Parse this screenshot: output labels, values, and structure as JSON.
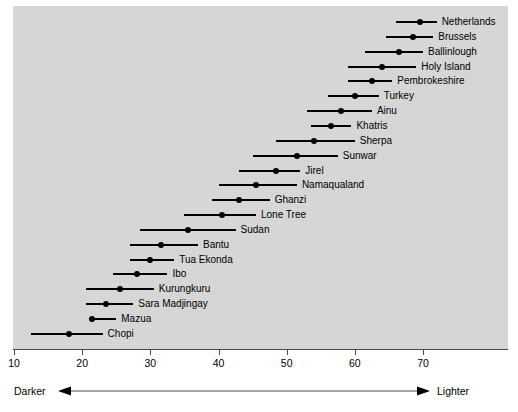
{
  "chart_data": {
    "type": "scatter",
    "title": "",
    "xlabel": "",
    "ylabel": "",
    "xlim": [
      10,
      76
    ],
    "xticks": [
      10,
      20,
      30,
      40,
      50,
      60,
      70
    ],
    "xtick_labels": [
      "10",
      "20",
      "30",
      "40",
      "50",
      "60",
      "70"
    ],
    "grid": false,
    "legend": null,
    "orientation": "horizontal",
    "marker": "point-with-range-line",
    "annotations": {
      "left_axis_note": "Darker",
      "right_axis_note": "Lighter",
      "arrow": "double-headed-horizontal-arrow"
    },
    "categories": [
      "Netherlands",
      "Brussels",
      "Ballinlough",
      "Holy Island",
      "Pembrokeshire",
      "Turkey",
      "Ainu",
      "Khatris",
      "Sherpa",
      "Sunwar",
      "Jirel",
      "Namaqualand",
      "Ghanzi",
      "Lone Tree",
      "Sudan",
      "Bantu",
      "Tua Ekonda",
      "Ibo",
      "Kurungkuru",
      "Sara Madjingay",
      "Mazua",
      "Chopi"
    ],
    "values": [
      69.5,
      68.5,
      66.5,
      64.0,
      62.5,
      60.0,
      58.0,
      56.5,
      54.0,
      51.5,
      48.5,
      45.5,
      43.0,
      40.5,
      35.5,
      31.5,
      30.0,
      28.0,
      25.5,
      23.5,
      21.5,
      18.0
    ],
    "range_low": [
      66.0,
      64.5,
      61.5,
      59.0,
      59.0,
      56.0,
      53.0,
      53.5,
      48.5,
      45.0,
      43.0,
      40.0,
      39.0,
      35.0,
      28.5,
      27.0,
      27.0,
      24.5,
      20.5,
      20.5,
      21.0,
      12.5
    ],
    "range_high": [
      72.0,
      71.5,
      70.0,
      69.0,
      65.5,
      63.5,
      62.5,
      59.5,
      60.0,
      57.5,
      52.0,
      51.5,
      47.5,
      45.5,
      42.5,
      37.0,
      33.5,
      32.5,
      30.5,
      27.5,
      25.0,
      23.0
    ],
    "series": [
      {
        "name": "reflectance",
        "values": [
          69.5,
          68.5,
          66.5,
          64.0,
          62.5,
          60.0,
          58.0,
          56.5,
          54.0,
          51.5,
          48.5,
          45.5,
          43.0,
          40.5,
          35.5,
          31.5,
          30.0,
          28.0,
          25.5,
          23.5,
          21.5,
          18.0
        ]
      }
    ]
  },
  "axis": {
    "ticks": [
      {
        "value": 10,
        "label": "10"
      },
      {
        "value": 20,
        "label": "20"
      },
      {
        "value": 30,
        "label": "30"
      },
      {
        "value": 40,
        "label": "40"
      },
      {
        "value": 50,
        "label": "50"
      },
      {
        "value": 60,
        "label": "60"
      },
      {
        "value": 70,
        "label": "70"
      }
    ],
    "darker_label": "Darker",
    "lighter_label": "Lighter"
  },
  "colors": {
    "plot_background": "#d6d6d6",
    "page_background": "#ffffff",
    "marker": "#000000",
    "axis": "#4a4a4a",
    "text": "#000000"
  },
  "rows": [
    {
      "label": "Netherlands",
      "value": 69.5,
      "low": 66.0,
      "high": 72.0
    },
    {
      "label": "Brussels",
      "value": 68.5,
      "low": 64.5,
      "high": 71.5
    },
    {
      "label": "Ballinlough",
      "value": 66.5,
      "low": 61.5,
      "high": 70.0
    },
    {
      "label": "Holy Island",
      "value": 64.0,
      "low": 59.0,
      "high": 69.0
    },
    {
      "label": "Pembrokeshire",
      "value": 62.5,
      "low": 59.0,
      "high": 65.5
    },
    {
      "label": "Turkey",
      "value": 60.0,
      "low": 56.0,
      "high": 63.5
    },
    {
      "label": "Ainu",
      "value": 58.0,
      "low": 53.0,
      "high": 62.5
    },
    {
      "label": "Khatris",
      "value": 56.5,
      "low": 53.5,
      "high": 59.5
    },
    {
      "label": "Sherpa",
      "value": 54.0,
      "low": 48.5,
      "high": 60.0
    },
    {
      "label": "Sunwar",
      "value": 51.5,
      "low": 45.0,
      "high": 57.5
    },
    {
      "label": "Jirel",
      "value": 48.5,
      "low": 43.0,
      "high": 52.0
    },
    {
      "label": "Namaqualand",
      "value": 45.5,
      "low": 40.0,
      "high": 51.5
    },
    {
      "label": "Ghanzi",
      "value": 43.0,
      "low": 39.0,
      "high": 47.5
    },
    {
      "label": "Lone Tree",
      "value": 40.5,
      "low": 35.0,
      "high": 45.5
    },
    {
      "label": "Sudan",
      "value": 35.5,
      "low": 28.5,
      "high": 42.5
    },
    {
      "label": "Bantu",
      "value": 31.5,
      "low": 27.0,
      "high": 37.0
    },
    {
      "label": "Tua Ekonda",
      "value": 30.0,
      "low": 27.0,
      "high": 33.5
    },
    {
      "label": "Ibo",
      "value": 28.0,
      "low": 24.5,
      "high": 32.5
    },
    {
      "label": "Kurungkuru",
      "value": 25.5,
      "low": 20.5,
      "high": 30.5
    },
    {
      "label": "Sara Madjingay",
      "value": 23.5,
      "low": 20.5,
      "high": 27.5
    },
    {
      "label": "Mazua",
      "value": 21.5,
      "low": 21.0,
      "high": 25.0
    },
    {
      "label": "Chopi",
      "value": 18.0,
      "low": 12.5,
      "high": 23.0
    }
  ]
}
